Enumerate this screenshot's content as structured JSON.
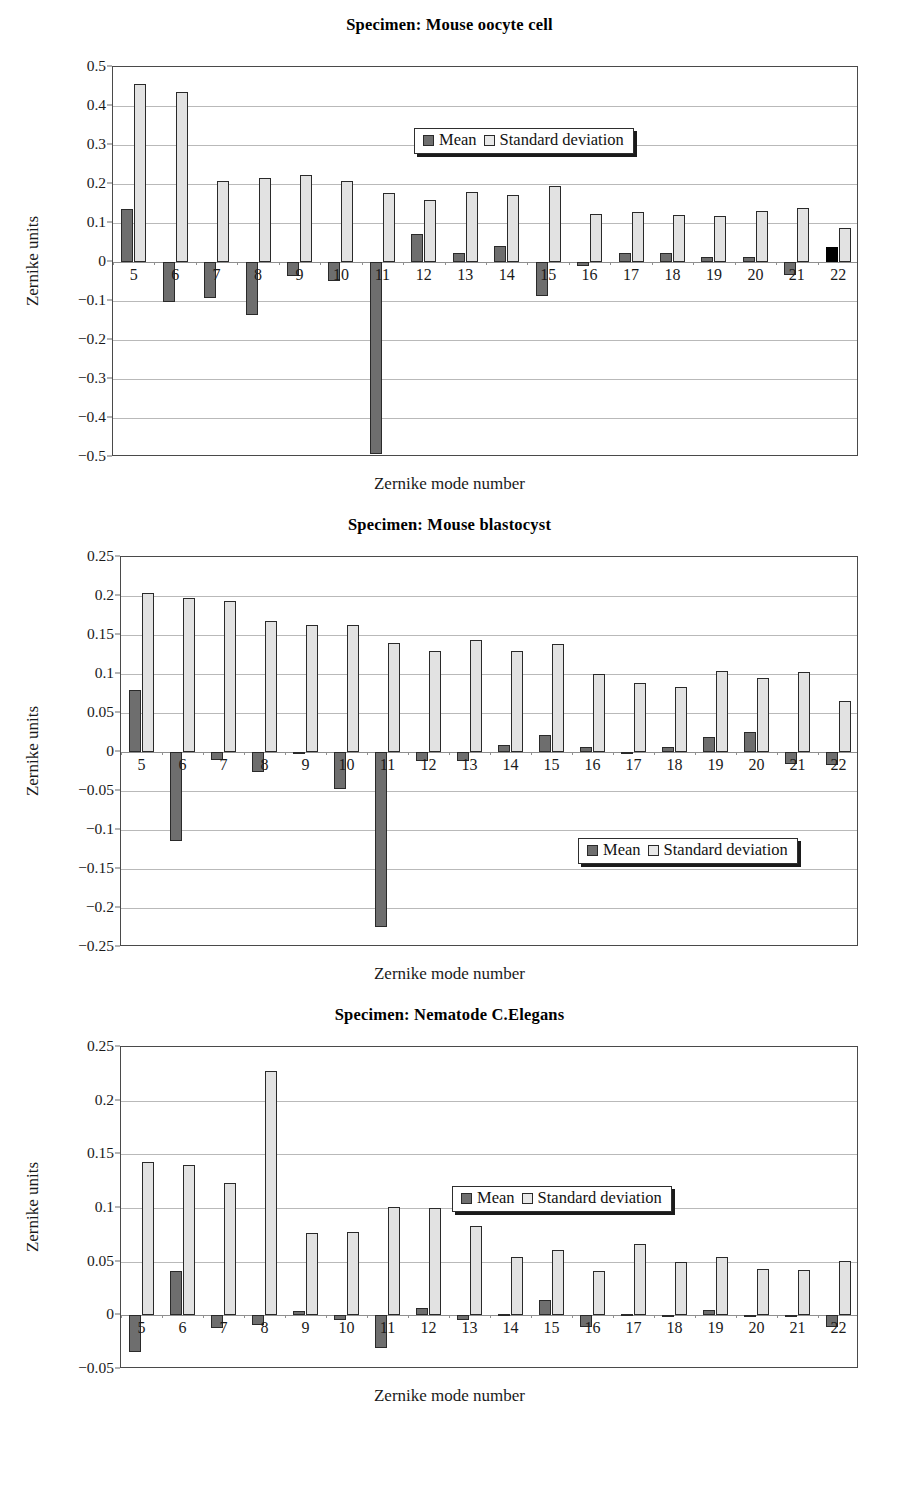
{
  "figure": {
    "axis_title_y": "Zernike units",
    "axis_title_x": "Zernike mode number",
    "legend": {
      "mean_label": "Mean",
      "std_label": "Standard deviation",
      "mean_color": "#6e6e6e",
      "std_color": "#e2e2e2",
      "highlight_color": "#000000"
    }
  },
  "chart_data": [
    {
      "type": "bar",
      "title": "Specimen: Mouse oocyte cell",
      "xlabel": "Zernike mode number",
      "ylabel": "Zernike units",
      "categories": [
        "5",
        "6",
        "7",
        "8",
        "9",
        "10",
        "11",
        "12",
        "13",
        "14",
        "15",
        "16",
        "17",
        "18",
        "19",
        "20",
        "21",
        "22"
      ],
      "ylim": [
        -0.5,
        0.5
      ],
      "yticks": [
        0.5,
        0.4,
        0.3,
        0.2,
        0.1,
        0,
        -0.1,
        -0.2,
        -0.3,
        -0.4,
        -0.5
      ],
      "ytick_labels": [
        "0.5",
        "0.4",
        "0.3",
        "0.2",
        "0.1",
        "0",
        "−0.1",
        "−0.2",
        "−0.3",
        "−0.4",
        "−0.5"
      ],
      "grid": true,
      "legend_position": "top-center",
      "series": [
        {
          "name": "Mean",
          "values": [
            0.135,
            -0.102,
            -0.092,
            -0.135,
            -0.035,
            -0.048,
            -0.492,
            0.072,
            0.022,
            0.042,
            -0.086,
            -0.011,
            0.024,
            0.023,
            0.013,
            0.013,
            -0.034,
            0.039
          ]
        },
        {
          "name": "Standard deviation",
          "values": [
            0.456,
            0.436,
            0.208,
            0.215,
            0.223,
            0.208,
            0.178,
            0.16,
            0.179,
            0.171,
            0.195,
            0.124,
            0.129,
            0.12,
            0.119,
            0.132,
            0.139,
            0.086
          ]
        }
      ],
      "highlight_index": 17
    },
    {
      "type": "bar",
      "title": "Specimen: Mouse blastocyst",
      "xlabel": "Zernike mode number",
      "ylabel": "Zernike units",
      "categories": [
        "5",
        "6",
        "7",
        "8",
        "9",
        "10",
        "11",
        "12",
        "13",
        "14",
        "15",
        "16",
        "17",
        "18",
        "19",
        "20",
        "21",
        "22"
      ],
      "ylim": [
        -0.25,
        0.25
      ],
      "yticks": [
        0.25,
        0.2,
        0.15,
        0.1,
        0.05,
        0,
        -0.05,
        -0.1,
        -0.15,
        -0.2,
        -0.25
      ],
      "ytick_labels": [
        "0.25",
        "0.2",
        "0.15",
        "0.1",
        "0.05",
        "0",
        "−0.05",
        "−0.1",
        "−0.15",
        "−0.2",
        "−0.25"
      ],
      "grid": true,
      "legend_position": "bottom-center",
      "series": [
        {
          "name": "Mean",
          "values": [
            0.08,
            -0.114,
            -0.01,
            -0.026,
            -0.002,
            -0.047,
            -0.224,
            -0.011,
            -0.011,
            0.009,
            0.022,
            0.006,
            -0.002,
            0.006,
            0.019,
            0.026,
            -0.016,
            -0.017
          ]
        },
        {
          "name": "Standard deviation",
          "values": [
            0.204,
            0.197,
            0.193,
            0.168,
            0.163,
            0.163,
            0.14,
            0.13,
            0.144,
            0.13,
            0.138,
            0.1,
            0.089,
            0.083,
            0.104,
            0.095,
            0.103,
            0.066
          ]
        }
      ],
      "highlight_index": null
    },
    {
      "type": "bar",
      "title": "Specimen: Nematode C.Elegans",
      "xlabel": "Zernike mode number",
      "ylabel": "Zernike units",
      "categories": [
        "5",
        "6",
        "7",
        "8",
        "9",
        "10",
        "11",
        "12",
        "13",
        "14",
        "15",
        "16",
        "17",
        "18",
        "19",
        "20",
        "21",
        "22"
      ],
      "ylim": [
        -0.05,
        0.25
      ],
      "yticks": [
        0.25,
        0.2,
        0.15,
        0.1,
        0.05,
        0,
        -0.05
      ],
      "ytick_labels": [
        "0.25",
        "0.2",
        "0.15",
        "0.1",
        "0.05",
        "0",
        "−0.05"
      ],
      "grid": true,
      "legend_position": "upper-center",
      "series": [
        {
          "name": "Mean",
          "values": [
            -0.034,
            0.041,
            -0.012,
            -0.009,
            0.004,
            -0.004,
            -0.03,
            0.007,
            -0.004,
            0.001,
            0.014,
            -0.011,
            0.001,
            -0.001,
            0.005,
            -0.001,
            -0.001,
            -0.011
          ]
        },
        {
          "name": "Standard deviation",
          "values": [
            0.143,
            0.14,
            0.123,
            0.228,
            0.077,
            0.078,
            0.101,
            0.1,
            0.083,
            0.054,
            0.061,
            0.041,
            0.066,
            0.05,
            0.054,
            0.043,
            0.042,
            0.051
          ]
        }
      ],
      "highlight_index": null
    }
  ]
}
